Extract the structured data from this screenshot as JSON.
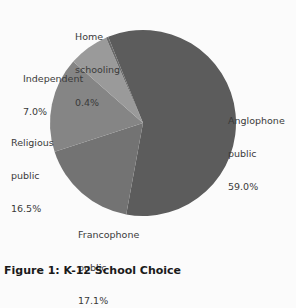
{
  "chart_data": {
    "type": "pie",
    "title": "Figure 1: K-12 School Choice",
    "categories": [
      "Anglophone public",
      "Francophone public",
      "Religious public",
      "Independent",
      "Home schooling"
    ],
    "values": [
      59.0,
      17.1,
      16.5,
      7.0,
      0.4
    ],
    "unit": "%",
    "colors": [
      "#5c5c5c",
      "#737373",
      "#858585",
      "#9a9a9a",
      "#6a6a6a"
    ],
    "start_angle_deg": -22,
    "direction": "clockwise",
    "legend": "none (direct labels)"
  },
  "labels": {
    "anglophone": {
      "line1": "Anglophone",
      "line2": "public",
      "value": "59.0%"
    },
    "francophone": {
      "line1": "Francophone",
      "line2": "public",
      "value": "17.1%"
    },
    "religious": {
      "line1": "Religious",
      "line2": "public",
      "value": "16.5%"
    },
    "independent": {
      "line1": "Independent",
      "value": "7.0%"
    },
    "home": {
      "line1": "Home",
      "line2": "schooling",
      "value": "0.4%"
    }
  },
  "caption": "Figure 1: K-12 School Choice"
}
